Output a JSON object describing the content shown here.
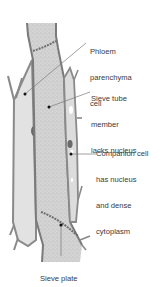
{
  "figure": {
    "colors": {
      "background": "#ffffff",
      "cell_wall": "#8a8a8a",
      "cell_wall_dark": "#6e6e6e",
      "parenchyma_fill": "#e2e2e2",
      "sieve_tube_fill": "#cfcfcf",
      "companion_fill": "#d9d9d9",
      "nucleus": "#6a6a6a",
      "leader_line": "#7a7a7a",
      "pointer_dot": "#111111",
      "label_text": "#3a3a3a"
    }
  },
  "labels": [
    {
      "id": "phloem-parenchyma",
      "lines": [
        "Phloem",
        "parenchyma",
        "cell"
      ]
    },
    {
      "id": "sieve-tube-member",
      "lines": [
        "Sieve tube",
        "member",
        "lacks nucleus"
      ]
    },
    {
      "id": "companion-cell",
      "lines": [
        "Companion cell",
        "has nucleus",
        "and dense",
        "cytoplasm"
      ]
    },
    {
      "id": "sieve-plate",
      "lines": [
        "Sieve plate"
      ]
    }
  ]
}
